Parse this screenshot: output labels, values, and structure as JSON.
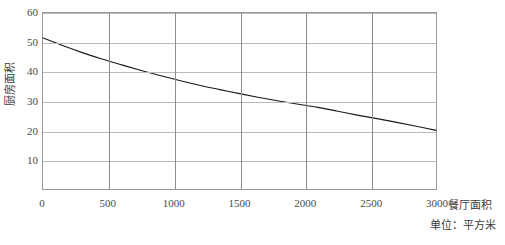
{
  "chart_data": {
    "type": "line",
    "title": "",
    "xlabel": "餐厅面积",
    "xunit": "单位：平方米",
    "ylabel": "厨房面积",
    "xlim": [
      0,
      3000
    ],
    "ylim": [
      0,
      60
    ],
    "xticks": [
      "0",
      "500",
      "1000",
      "1500",
      "2000",
      "2500",
      "3000"
    ],
    "xtick_values": [
      0,
      500,
      1000,
      1500,
      2000,
      2500,
      3000
    ],
    "yticks": [
      "10",
      "20",
      "30",
      "40",
      "50",
      "60"
    ],
    "ytick_values": [
      10,
      20,
      30,
      40,
      50,
      60
    ],
    "grid": "both",
    "legend": "none",
    "series": [
      {
        "name": "厨房面积",
        "color": "#1a1a1a",
        "x": [
          0,
          150,
          300,
          450,
          600,
          750,
          900,
          1050,
          1200,
          1350,
          1500,
          1650,
          1800,
          1950,
          2100,
          2250,
          2400,
          2550,
          2700,
          2850,
          3000
        ],
        "y": [
          51.5,
          48.9,
          46.5,
          44.3,
          42.3,
          40.4,
          38.6,
          36.9,
          35.3,
          33.9,
          32.5,
          31.2,
          30.0,
          28.9,
          27.8,
          26.5,
          25.2,
          24.0,
          22.7,
          21.4,
          20.0
        ]
      }
    ],
    "colors": {
      "curve": "#1a1a1a",
      "frame": "#9a9a9a",
      "gridline_horizontal": "#b9b9b9",
      "gridline_vertical": "#8d8d8d",
      "text": "#3a3a3a",
      "background": "#ffffff"
    }
  }
}
